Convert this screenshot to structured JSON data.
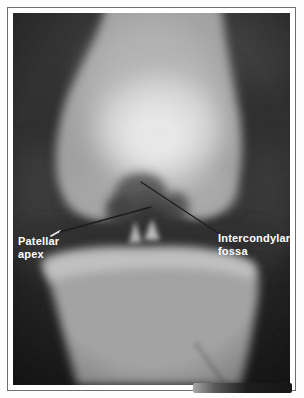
{
  "figure": {
    "frame_border_color": "#6e6e6e",
    "mat_color": "#ffffff",
    "film_background": "#202020"
  },
  "annotations": {
    "label_color": "#ffffff",
    "leader_line_color": "#1c1c1c",
    "leader_tick_color": "#f2f2f2",
    "patellar_apex": {
      "line1": "Patellar",
      "line2": "apex"
    },
    "intercondylar_fossa": {
      "line1": "Intercondylar",
      "line2": "fossa"
    }
  }
}
